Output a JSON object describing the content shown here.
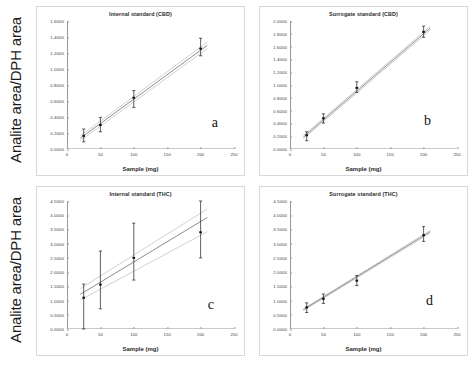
{
  "figure": {
    "shared_ylabel": "Analite area/DPH area",
    "shared_xlabel": "Sample (mg)"
  },
  "chart_data": [
    {
      "type": "scatter",
      "panel": "a",
      "title": "Internal standard (CBD)",
      "xlabel": "Sample (mg)",
      "ylabel": "Analite area/DPH area",
      "xlim": [
        0,
        250
      ],
      "ylim": [
        0.0,
        1.6
      ],
      "xticks": [
        0,
        50,
        100,
        150,
        200,
        250
      ],
      "xtick_labels": [
        "0",
        "50",
        "100",
        "150",
        "200",
        "250"
      ],
      "yticks": [
        0.0,
        0.2,
        0.4,
        0.6,
        0.8,
        1.0,
        1.2,
        1.4,
        1.6
      ],
      "ytick_labels": [
        "0.0000",
        "0.2000",
        "0.4000",
        "0.6000",
        "0.8000",
        "1.0000",
        "1.2000",
        "1.4000",
        "1.6000"
      ],
      "grid": false,
      "legend": "none",
      "x": [
        25,
        50,
        100,
        200
      ],
      "y": [
        0.165,
        0.3,
        0.64,
        1.255
      ],
      "yerr_low": [
        0.075,
        0.085,
        0.12,
        0.09
      ],
      "yerr_high": [
        0.085,
        0.095,
        0.09,
        0.13
      ],
      "fit": {
        "x": [
          20,
          210
        ],
        "y": [
          0.135,
          1.295
        ]
      },
      "band_upper": {
        "x": [
          20,
          210
        ],
        "y": [
          0.165,
          1.335
        ]
      },
      "band_lower": {
        "x": [
          20,
          210
        ],
        "y": [
          0.105,
          1.255
        ]
      }
    },
    {
      "type": "scatter",
      "panel": "b",
      "title": "Surrogate standard (CBD)",
      "xlabel": "Sample (mg)",
      "ylabel": "Analite area/DPH area",
      "xlim": [
        0,
        250
      ],
      "ylim": [
        0.0,
        2.0
      ],
      "xticks": [
        0,
        50,
        100,
        150,
        200,
        250
      ],
      "xtick_labels": [
        "0",
        "50",
        "100",
        "150",
        "200",
        "250"
      ],
      "yticks": [
        0.0,
        0.2,
        0.4,
        0.6,
        0.8,
        1.0,
        1.2,
        1.4,
        1.6,
        1.8,
        2.0
      ],
      "ytick_labels": [
        "0.0000",
        "0.2000",
        "0.4000",
        "0.6000",
        "0.8000",
        "1.0000",
        "1.2000",
        "1.4000",
        "1.6000",
        "1.8000",
        "2.0000"
      ],
      "grid": false,
      "legend": "none",
      "x": [
        25,
        50,
        100,
        200
      ],
      "y": [
        0.215,
        0.48,
        0.955,
        1.83
      ],
      "yerr_low": [
        0.085,
        0.075,
        0.07,
        0.085
      ],
      "yerr_high": [
        0.055,
        0.07,
        0.095,
        0.09
      ],
      "fit": {
        "x": [
          20,
          210
        ],
        "y": [
          0.185,
          1.89
        ]
      },
      "band_upper": {
        "x": [
          20,
          210
        ],
        "y": [
          0.21,
          1.92
        ]
      },
      "band_lower": {
        "x": [
          20,
          210
        ],
        "y": [
          0.16,
          1.86
        ]
      }
    },
    {
      "type": "scatter",
      "panel": "c",
      "title": "Internal standard (THC)",
      "xlabel": "Sample (mg)",
      "ylabel": "Analite area/DPH area",
      "xlim": [
        0,
        250
      ],
      "ylim": [
        0.0,
        4.5
      ],
      "xticks": [
        0,
        50,
        100,
        150,
        200,
        250
      ],
      "xtick_labels": [
        "0",
        "50",
        "100",
        "150",
        "200",
        "250"
      ],
      "yticks": [
        0.0,
        0.5,
        1.0,
        1.5,
        2.0,
        2.5,
        3.0,
        3.5,
        4.0,
        4.5
      ],
      "ytick_labels": [
        "0.0000",
        "0.5000",
        "1.0000",
        "1.5000",
        "2.0000",
        "2.5000",
        "3.0000",
        "3.5000",
        "4.0000",
        "4.5000"
      ],
      "grid": false,
      "legend": "none",
      "x": [
        25,
        50,
        100,
        200
      ],
      "y": [
        1.1,
        1.56,
        2.5,
        3.4
      ],
      "yerr_low": [
        1.1,
        0.85,
        0.78,
        0.9
      ],
      "yerr_high": [
        0.48,
        1.18,
        1.22,
        1.1
      ],
      "fit": {
        "x": [
          20,
          210
        ],
        "y": [
          1.22,
          3.92
        ]
      },
      "band_upper": {
        "x": [
          20,
          210
        ],
        "y": [
          1.42,
          4.22
        ]
      },
      "band_lower": {
        "x": [
          20,
          210
        ],
        "y": [
          1.02,
          3.42
        ]
      }
    },
    {
      "type": "scatter",
      "panel": "d",
      "title": "Surrogate standard (THC)",
      "xlabel": "Sample (mg)",
      "ylabel": "Analite area/DPH area",
      "xlim": [
        0,
        250
      ],
      "ylim": [
        0.0,
        4.5
      ],
      "xticks": [
        0,
        50,
        100,
        150,
        200,
        250
      ],
      "xtick_labels": [
        "0",
        "50",
        "100",
        "150",
        "200",
        "250"
      ],
      "yticks": [
        0.0,
        0.5,
        1.0,
        1.5,
        2.0,
        2.5,
        3.0,
        3.5,
        4.0,
        4.5
      ],
      "ytick_labels": [
        "0.0000",
        "0.5000",
        "1.0000",
        "1.5000",
        "2.0000",
        "2.5000",
        "3.0000",
        "3.5000",
        "4.0000",
        "4.5000"
      ],
      "grid": false,
      "legend": "none",
      "x": [
        25,
        50,
        100,
        200
      ],
      "y": [
        0.76,
        1.06,
        1.7,
        3.3
      ],
      "yerr_low": [
        0.18,
        0.16,
        0.17,
        0.22
      ],
      "yerr_high": [
        0.16,
        0.17,
        0.18,
        0.3
      ],
      "fit": {
        "x": [
          20,
          210
        ],
        "y": [
          0.68,
          3.42
        ]
      },
      "band_upper": {
        "x": [
          20,
          210
        ],
        "y": [
          0.71,
          3.47
        ]
      },
      "band_lower": {
        "x": [
          20,
          210
        ],
        "y": [
          0.65,
          3.37
        ]
      }
    }
  ]
}
